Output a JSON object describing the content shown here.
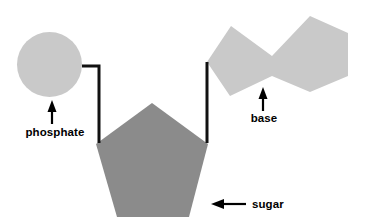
{
  "figure": {
    "background_color": "#ffffff"
  },
  "colors": {
    "phosphate_fill": "#c9c9c9",
    "base_fill": "#c9c9c9",
    "sugar_fill": "#8b8b8b",
    "bond_line": "#111111",
    "label_text": "#000000",
    "arrow": "#000000"
  },
  "shapes": {
    "phosphate": {
      "icon": "circle-shape",
      "center_x": 49.5,
      "center_y": 64.5,
      "radius": 32.5,
      "fill": "#c9c9c9"
    },
    "sugar": {
      "icon": "pentagon-shape",
      "points": "152,103 208,144 189,217 117,217 96,144",
      "fill": "#8b8b8b"
    },
    "base": {
      "icon": "fused-ring-shape",
      "points": "231,26 207,62 230,96 272,76 310,92 348,76 348,33 310,16 272,56",
      "fill": "#c9c9c9"
    }
  },
  "bonds": {
    "phosphate_to_sugar": {
      "name": "phosphate-sugar-bond",
      "path": "M 82,66 L 99,66 L 99,143",
      "stroke_width": 3
    },
    "base_to_sugar": {
      "name": "base-sugar-bond",
      "path": "M 207,62 L 207,143",
      "stroke_width": 3
    }
  },
  "labels": [
    {
      "id": "phosphate",
      "text": "phosphate",
      "x": 55,
      "y": 136,
      "anchor": "middle",
      "arrow": {
        "name": "up-arrow-phosphate",
        "direction": "up",
        "shaft": "M 52,124 L 52,108",
        "head": "52,100 47.5,112 56.5,112"
      }
    },
    {
      "id": "base",
      "text": "base",
      "x": 264,
      "y": 122,
      "anchor": "middle",
      "arrow": {
        "name": "up-arrow-base",
        "direction": "up",
        "shaft": "M 263,111 L 263,95",
        "head": "263,87 258.5,99 267.5,99"
      }
    },
    {
      "id": "sugar",
      "text": "sugar",
      "x": 252,
      "y": 208,
      "anchor": "start",
      "arrow": {
        "name": "left-arrow-sugar",
        "direction": "left",
        "shaft": "M 246,204 L 222,204",
        "head": "211,204 224,199 224,209"
      }
    }
  ]
}
